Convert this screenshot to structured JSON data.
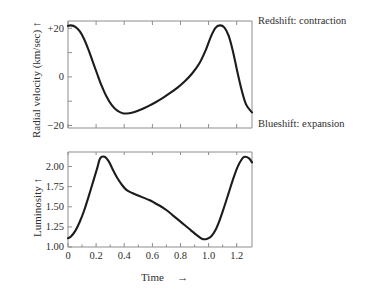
{
  "figure": {
    "top_panel": {
      "y_axis_title": "Radial velocity (km/sec)",
      "y_axis_arrow": "↑",
      "y_ticks": [
        "+20",
        "0",
        "−20"
      ],
      "annotation_top": "Redshift: contraction",
      "annotation_bottom": "Blueshift: expansion"
    },
    "bottom_panel": {
      "y_axis_title": "Luminosity",
      "y_axis_arrow": "↑",
      "y_ticks": [
        "2.00",
        "1.75",
        "1.50",
        "1.25",
        "1.00"
      ],
      "x_ticks": [
        "0",
        "0.2",
        "0.4",
        "0.6",
        "0.8",
        "1.0",
        "1.2"
      ],
      "x_axis_title": "Time",
      "x_axis_arrow": "→"
    }
  },
  "chart_data": [
    {
      "type": "line",
      "title": "",
      "xlabel": "Time",
      "ylabel": "Radial velocity (km/sec)",
      "xlim": [
        0,
        1.26
      ],
      "ylim": [
        -20,
        24
      ],
      "ytick_values": [
        20,
        0,
        -20
      ],
      "ytick_labels": [
        "+20",
        "0",
        "−20"
      ],
      "xtick_values": [
        0,
        0.2,
        0.4,
        0.6,
        0.8,
        1.0,
        1.2
      ],
      "xtick_labels": [
        "0",
        "0.2",
        "0.4",
        "0.6",
        "0.8",
        "1.0",
        "1.2"
      ],
      "grid": false,
      "legend": "none",
      "annotations": [
        {
          "text": "Redshift: contraction",
          "position": "right-top"
        },
        {
          "text": "Blueshift: expansion",
          "position": "right-bottom"
        }
      ],
      "series": [
        {
          "name": "Radial velocity",
          "color": "#1c1c1c",
          "x": [
            0.0,
            0.02,
            0.05,
            0.08,
            0.11,
            0.14,
            0.17,
            0.2,
            0.23,
            0.26,
            0.3,
            0.34,
            0.38,
            0.42,
            0.46,
            0.5,
            0.55,
            0.6,
            0.65,
            0.7,
            0.75,
            0.8,
            0.85,
            0.9,
            0.94,
            0.98,
            1.01,
            1.04,
            1.07,
            1.1,
            1.13,
            1.16,
            1.19,
            1.22,
            1.26
          ],
          "y": [
            22.0,
            22.2,
            21.6,
            19.8,
            16.6,
            12.2,
            7.2,
            2.2,
            -2.6,
            -6.6,
            -10.6,
            -13.0,
            -14.0,
            -13.9,
            -13.3,
            -12.4,
            -11.0,
            -9.4,
            -7.6,
            -5.6,
            -3.4,
            -0.8,
            2.4,
            6.6,
            11.6,
            17.8,
            21.2,
            22.2,
            21.4,
            18.0,
            11.4,
            3.0,
            -4.6,
            -10.4,
            -13.6
          ]
        }
      ]
    },
    {
      "type": "line",
      "title": "",
      "xlabel": "Time",
      "ylabel": "Luminosity",
      "xlim": [
        0,
        1.26
      ],
      "ylim": [
        1.0,
        2.18
      ],
      "ytick_values": [
        2.0,
        1.75,
        1.5,
        1.25,
        1.0
      ],
      "ytick_labels": [
        "2.00",
        "1.75",
        "1.50",
        "1.25",
        "1.00"
      ],
      "xtick_values": [
        0,
        0.2,
        0.4,
        0.6,
        0.8,
        1.0,
        1.2
      ],
      "xtick_labels": [
        "0",
        "0.2",
        "0.4",
        "0.6",
        "0.8",
        "1.0",
        "1.2"
      ],
      "grid": false,
      "legend": "none",
      "series": [
        {
          "name": "Luminosity",
          "color": "#1c1c1c",
          "x": [
            0.0,
            0.02,
            0.05,
            0.08,
            0.11,
            0.14,
            0.17,
            0.2,
            0.22,
            0.25,
            0.28,
            0.31,
            0.34,
            0.37,
            0.4,
            0.44,
            0.48,
            0.52,
            0.56,
            0.6,
            0.64,
            0.68,
            0.72,
            0.76,
            0.8,
            0.84,
            0.88,
            0.92,
            0.95,
            0.98,
            1.01,
            1.04,
            1.07,
            1.1,
            1.13,
            1.16,
            1.19,
            1.21,
            1.24,
            1.26
          ],
          "y": [
            1.11,
            1.13,
            1.2,
            1.31,
            1.45,
            1.62,
            1.8,
            1.98,
            2.1,
            2.12,
            2.06,
            1.95,
            1.85,
            1.77,
            1.71,
            1.67,
            1.64,
            1.61,
            1.58,
            1.54,
            1.5,
            1.45,
            1.39,
            1.33,
            1.27,
            1.21,
            1.15,
            1.1,
            1.1,
            1.13,
            1.21,
            1.34,
            1.5,
            1.67,
            1.84,
            1.99,
            2.09,
            2.12,
            2.1,
            2.05
          ]
        }
      ]
    }
  ]
}
